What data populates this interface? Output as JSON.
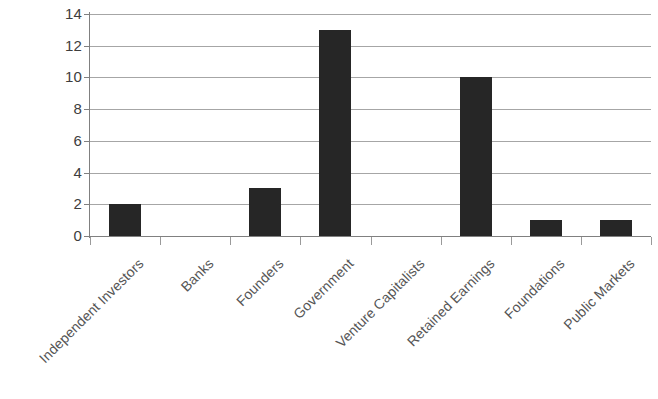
{
  "chart_data": {
    "type": "bar",
    "title": "",
    "subtitle": "",
    "xlabel": "",
    "ylabel": "",
    "categories": [
      "Independent Investors",
      "Banks",
      "Founders",
      "Government",
      "Venture Capitalists",
      "Retained Earnings",
      "Foundations",
      "Public Markets"
    ],
    "values": [
      2,
      0,
      3,
      13,
      0,
      10,
      1,
      1
    ],
    "ylim": [
      0,
      14
    ],
    "ytick_step": 2,
    "yticks": [
      "14",
      "12",
      "10",
      "8",
      "6",
      "4",
      "2",
      "0"
    ],
    "ytick_values": [
      14,
      12,
      10,
      8,
      6,
      4,
      2,
      0
    ],
    "grid": "horizontal",
    "legend": "none",
    "bar_color": "#262626",
    "gridline_color": "#a6a6a6",
    "axis_color": "#808080",
    "background_color": "#ffffff",
    "xlabel_rotation_degrees": -45
  }
}
